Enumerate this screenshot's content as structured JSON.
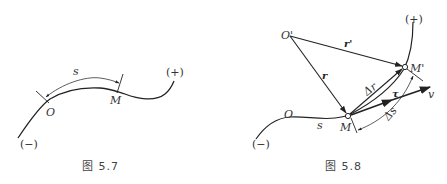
{
  "figure_5_7": {
    "caption": "图 5.7",
    "labels": {
      "arc_length": "s",
      "origin": "O",
      "point": "M",
      "positive": "(+)",
      "negative": "(−)"
    }
  },
  "figure_5_8": {
    "caption": "图 5.8",
    "labels": {
      "fixed_point": "O'",
      "position_vector": "r",
      "position_vector_prime": "r'",
      "point": "M",
      "point_prime": "M'",
      "displacement": "Δr",
      "tangent_unit": "τ",
      "velocity": "v",
      "arc_increment": "Δs",
      "arc_length": "s",
      "origin": "O",
      "positive": "(+)",
      "negative": "(−)"
    }
  },
  "colors": {
    "line": "#222222",
    "text": "#333333",
    "background": "#ffffff"
  }
}
